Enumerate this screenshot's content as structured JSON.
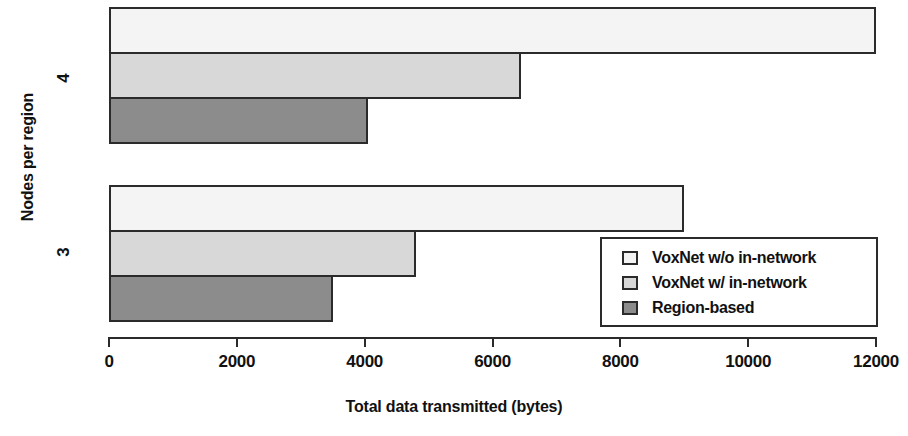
{
  "chart_data": {
    "type": "bar",
    "orientation": "horizontal",
    "title": "",
    "xlabel": "Total data transmitted (bytes)",
    "ylabel": "Nodes per region",
    "categories": [
      "4",
      "3"
    ],
    "xlim": [
      0,
      12000
    ],
    "xticks": [
      0,
      2000,
      4000,
      6000,
      8000,
      10000,
      12000
    ],
    "xtick_labels": [
      "0",
      "2000",
      "4000",
      "6000",
      "8000",
      "10000",
      "12000"
    ],
    "grid": false,
    "legend_position": "bottom-right",
    "series": [
      {
        "name": "VoxNet w/o in-network",
        "color": "#f4f4f4",
        "values": [
          12000,
          9000
        ]
      },
      {
        "name": "VoxNet w/ in-network",
        "color": "#d8d8d8",
        "values": [
          6450,
          4800
        ]
      },
      {
        "name": "Region-based",
        "color": "#8c8c8c",
        "values": [
          4050,
          3500
        ]
      }
    ],
    "legend_entries": [
      {
        "label": "VoxNet w/o in-network",
        "color": "#f4f4f4"
      },
      {
        "label": "VoxNet w/ in-network",
        "color": "#d8d8d8"
      },
      {
        "label": "Region-based",
        "color": "#8c8c8c"
      }
    ],
    "axis_color": "#2b2b2b",
    "bar_border_color": "#2b2b2b"
  }
}
